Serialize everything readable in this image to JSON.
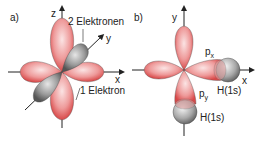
{
  "panel_a": {
    "label": "a)",
    "axes": {
      "z": "z",
      "y": "y",
      "x": "x"
    },
    "annotations": {
      "two_electrons": "2 Elektronen",
      "one_electron": "1 Elektron"
    }
  },
  "panel_b": {
    "label": "b)",
    "axes": {
      "y": "y",
      "x": "x"
    },
    "orbitals": {
      "px": "p",
      "px_sub": "x",
      "py": "p",
      "py_sub": "y"
    },
    "hydrogen": {
      "h1": "H(1s)",
      "h2": "H(1s)"
    }
  },
  "colors": {
    "lobe_red": "#e06060",
    "lobe_red_light": "#f6d0d0",
    "lobe_grey": "#6e6e6e",
    "lobe_grey_light": "#d0d0d0",
    "axis": "#222222"
  }
}
